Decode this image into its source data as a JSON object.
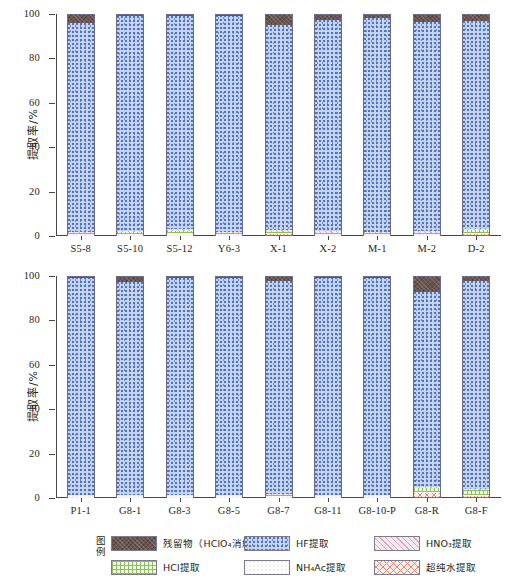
{
  "axes": {
    "y_title": "提取率/%",
    "y_ticks": [
      0,
      20,
      40,
      60,
      80,
      100
    ],
    "y_min": 0,
    "y_max": 100
  },
  "legend": {
    "tag": "图例",
    "items": [
      {
        "key": "residue",
        "label": "残留物（HClO₄消解）",
        "color": "#6b5450"
      },
      {
        "key": "hf",
        "label": "HF提取",
        "color": "#c3d3f0"
      },
      {
        "key": "hno3",
        "label": "HNO₃提取",
        "color": "#f3eaee"
      },
      {
        "key": "hcl",
        "label": "HCl提取",
        "color": "#f2f8e8"
      },
      {
        "key": "nh4ac",
        "label": "NH₄Ac提取",
        "color": "#fdfdfd"
      },
      {
        "key": "water",
        "label": "超纯水提取",
        "color": "#fdeeea"
      }
    ]
  },
  "chart_data": [
    {
      "type": "bar",
      "stacked": true,
      "panel": "top",
      "title": "",
      "xlabel": "",
      "ylabel": "提取率/%",
      "ylim": [
        0,
        100
      ],
      "grid": false,
      "legend_position": "bottom",
      "categories": [
        "S5-8",
        "S5-10",
        "S5-12",
        "Y6-3",
        "X-1",
        "X-2",
        "M-1",
        "M-2",
        "D-2"
      ],
      "series": [
        {
          "name": "超纯水提取",
          "values": [
            0.2,
            0.2,
            0.2,
            0.2,
            0.3,
            0.2,
            0.2,
            0.2,
            0.3
          ]
        },
        {
          "name": "NH₄Ac提取",
          "values": [
            0.3,
            0.4,
            0.6,
            0.3,
            0.5,
            0.4,
            0.4,
            0.4,
            0.5
          ]
        },
        {
          "name": "HCl提取",
          "values": [
            0.3,
            0.6,
            1.0,
            0.4,
            0.6,
            0.5,
            0.4,
            0.5,
            1.3
          ]
        },
        {
          "name": "HNO₃提取",
          "values": [
            0.4,
            0.7,
            1.0,
            0.5,
            1.0,
            0.6,
            0.5,
            0.6,
            0.8
          ]
        },
        {
          "name": "HF提取",
          "values": [
            95.3,
            97.7,
            96.8,
            98.4,
            93.1,
            96.1,
            97.3,
            95.1,
            94.3
          ]
        },
        {
          "name": "残留物（HClO₄消解）",
          "values": [
            3.5,
            0.4,
            0.4,
            0.2,
            4.5,
            2.2,
            1.2,
            3.2,
            2.8
          ]
        }
      ]
    },
    {
      "type": "bar",
      "stacked": true,
      "panel": "bottom",
      "title": "",
      "xlabel": "",
      "ylabel": "提取率/%",
      "ylim": [
        0,
        100
      ],
      "grid": false,
      "legend_position": "bottom",
      "categories": [
        "P1-1",
        "G8-1",
        "G8-3",
        "G8-5",
        "G8-7",
        "G8-11",
        "G8-10-P",
        "G8-R",
        "G8-F"
      ],
      "series": [
        {
          "name": "超纯水提取",
          "values": [
            0.2,
            0.2,
            0.2,
            0.2,
            0.2,
            0.2,
            0.2,
            1.6,
            0.6
          ]
        },
        {
          "name": "NH₄Ac提取",
          "values": [
            0.3,
            0.3,
            0.3,
            0.3,
            0.3,
            0.3,
            0.3,
            0.6,
            0.5
          ]
        },
        {
          "name": "HCl提取",
          "values": [
            0.3,
            0.3,
            0.3,
            0.3,
            0.3,
            0.3,
            0.3,
            1.9,
            2.1
          ]
        },
        {
          "name": "HNO₃提取",
          "values": [
            0.3,
            0.3,
            0.3,
            0.3,
            0.4,
            0.3,
            0.3,
            0.6,
            0.6
          ]
        },
        {
          "name": "HF提取",
          "values": [
            98.7,
            96.6,
            98.6,
            98.7,
            96.8,
            98.7,
            98.7,
            88.3,
            94.2
          ]
        },
        {
          "name": "残留物（HClO₄消解）",
          "values": [
            0.2,
            2.3,
            0.3,
            0.2,
            2.0,
            0.2,
            0.2,
            7.0,
            2.0
          ]
        }
      ]
    }
  ]
}
